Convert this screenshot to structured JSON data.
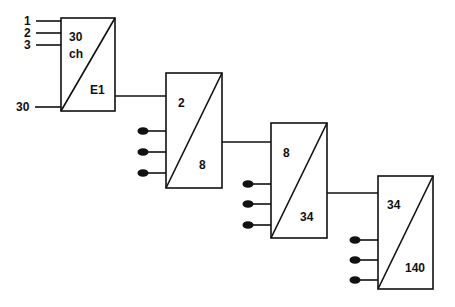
{
  "diagram": {
    "type": "cascaded-converter-chain",
    "stroke_color": "#111111",
    "background": "#ffffff",
    "stage1": {
      "inputs": [
        "1",
        "2",
        "3",
        "30"
      ],
      "top_label": "30",
      "top_sublabel": "ch",
      "bottom_label": "E1"
    },
    "stage2": {
      "top_label": "2",
      "bottom_label": "8",
      "tributary_dots": 3
    },
    "stage3": {
      "top_label": "8",
      "bottom_label": "34",
      "tributary_dots": 3
    },
    "stage4": {
      "top_label": "34",
      "bottom_label": "140",
      "tributary_dots": 3
    }
  }
}
